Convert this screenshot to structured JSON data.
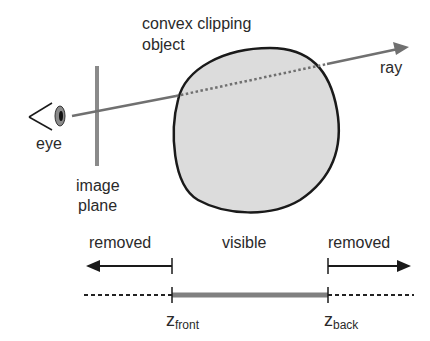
{
  "diagram": {
    "labels": {
      "object_line1": "convex clipping",
      "object_line2": "object",
      "ray": "ray",
      "eye": "eye",
      "image_plane_line1": "image",
      "image_plane_line2": "plane",
      "removed_left": "removed",
      "visible": "visible",
      "removed_right": "removed",
      "z_front_main": "z",
      "z_front_sub": "front",
      "z_back_main": "z",
      "z_back_sub": "back"
    },
    "colors": {
      "background": "#ffffff",
      "text": "#2a2a2a",
      "object_fill": "#dcdcdc",
      "object_stroke": "#1a1a1a",
      "ray": "#707070",
      "image_plane": "#8a8a8a",
      "visible_segment": "#808080",
      "dashed_segment": "#222222"
    },
    "elements": [
      "eye",
      "image plane",
      "ray",
      "convex clipping object",
      "depth axis with z_front and z_back"
    ]
  }
}
